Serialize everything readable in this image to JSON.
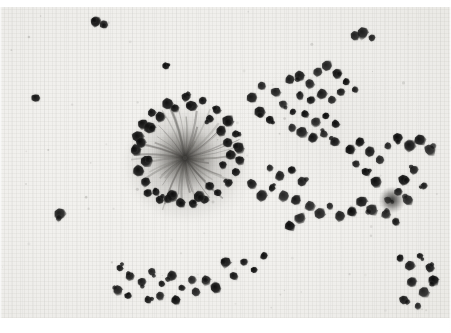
{
  "figure": {
    "caption": "",
    "modality": "light-microscopy",
    "stain_tone": "grayscale",
    "background_color": "#f2f1ee",
    "cell_color": "#1a1a1a",
    "rosette_core_color": "#4a4844",
    "width": 451,
    "height": 333,
    "plate": {
      "x": 0,
      "y": 7,
      "width": 451,
      "height": 311
    }
  },
  "scene": {
    "rosette": {
      "label": "central-rosette",
      "center_x": 185,
      "center_y": 158,
      "core_radius": 34,
      "halo_radius": 62,
      "ray_count": 46,
      "ring_cell_count": 38
    },
    "clusters": [
      {
        "label": "right-upper-cluster",
        "center_x": 330,
        "center_y": 112,
        "cell_count": 34
      },
      {
        "label": "right-lower-cluster",
        "center_x": 392,
        "center_y": 205,
        "cell_count": 22
      },
      {
        "label": "bottom-left-cluster",
        "center_x": 155,
        "center_y": 285,
        "cell_count": 14
      },
      {
        "label": "bottom-right-cluster",
        "center_x": 420,
        "center_y": 275,
        "cell_count": 10
      },
      {
        "label": "scattered-field",
        "center_x": 260,
        "center_y": 200,
        "cell_count": 26
      }
    ],
    "ring_cells": [
      [
        186,
        97
      ],
      [
        203,
        101
      ],
      [
        168,
        104
      ],
      [
        217,
        110
      ],
      [
        152,
        113
      ],
      [
        228,
        121
      ],
      [
        143,
        124
      ],
      [
        236,
        134
      ],
      [
        138,
        137
      ],
      [
        239,
        148
      ],
      [
        136,
        150
      ],
      [
        240,
        160
      ],
      [
        139,
        171
      ],
      [
        236,
        172
      ],
      [
        146,
        182
      ],
      [
        229,
        183
      ],
      [
        156,
        192
      ],
      [
        218,
        193
      ],
      [
        168,
        199
      ],
      [
        205,
        200
      ],
      [
        181,
        203
      ],
      [
        193,
        204
      ],
      [
        160,
        200
      ],
      [
        210,
        186
      ],
      [
        148,
        193
      ],
      [
        223,
        165
      ],
      [
        231,
        155
      ],
      [
        146,
        161
      ],
      [
        141,
        143
      ],
      [
        150,
        128
      ],
      [
        160,
        117
      ],
      [
        175,
        108
      ],
      [
        192,
        106
      ],
      [
        210,
        119
      ],
      [
        221,
        131
      ],
      [
        228,
        143
      ],
      [
        199,
        197
      ],
      [
        172,
        196
      ]
    ],
    "scatter_cells": [
      [
        96,
        22
      ],
      [
        104,
        25
      ],
      [
        355,
        36
      ],
      [
        363,
        33
      ],
      [
        372,
        38
      ],
      [
        290,
        80
      ],
      [
        300,
        76
      ],
      [
        310,
        84
      ],
      [
        318,
        72
      ],
      [
        327,
        66
      ],
      [
        337,
        74
      ],
      [
        346,
        82
      ],
      [
        355,
        90
      ],
      [
        300,
        96
      ],
      [
        311,
        100
      ],
      [
        322,
        94
      ],
      [
        332,
        100
      ],
      [
        341,
        92
      ],
      [
        283,
        104
      ],
      [
        293,
        112
      ],
      [
        305,
        114
      ],
      [
        316,
        122
      ],
      [
        326,
        116
      ],
      [
        336,
        124
      ],
      [
        292,
        128
      ],
      [
        302,
        132
      ],
      [
        313,
        138
      ],
      [
        324,
        134
      ],
      [
        335,
        142
      ],
      [
        270,
        120
      ],
      [
        260,
        112
      ],
      [
        252,
        98
      ],
      [
        262,
        86
      ],
      [
        276,
        92
      ],
      [
        270,
        168
      ],
      [
        280,
        176
      ],
      [
        292,
        170
      ],
      [
        302,
        182
      ],
      [
        272,
        188
      ],
      [
        284,
        196
      ],
      [
        296,
        200
      ],
      [
        262,
        196
      ],
      [
        252,
        184
      ],
      [
        350,
        150
      ],
      [
        360,
        142
      ],
      [
        370,
        152
      ],
      [
        380,
        160
      ],
      [
        356,
        164
      ],
      [
        366,
        172
      ],
      [
        376,
        182
      ],
      [
        388,
        200
      ],
      [
        398,
        192
      ],
      [
        408,
        200
      ],
      [
        386,
        214
      ],
      [
        396,
        222
      ],
      [
        372,
        210
      ],
      [
        362,
        202
      ],
      [
        352,
        212
      ],
      [
        404,
        180
      ],
      [
        414,
        170
      ],
      [
        424,
        186
      ],
      [
        430,
        150
      ],
      [
        420,
        140
      ],
      [
        410,
        146
      ],
      [
        398,
        138
      ],
      [
        388,
        146
      ],
      [
        310,
        206
      ],
      [
        320,
        214
      ],
      [
        330,
        206
      ],
      [
        340,
        216
      ],
      [
        300,
        218
      ],
      [
        290,
        226
      ],
      [
        120,
        268
      ],
      [
        130,
        276
      ],
      [
        142,
        282
      ],
      [
        152,
        272
      ],
      [
        162,
        284
      ],
      [
        172,
        276
      ],
      [
        182,
        288
      ],
      [
        192,
        280
      ],
      [
        118,
        290
      ],
      [
        128,
        296
      ],
      [
        148,
        300
      ],
      [
        160,
        296
      ],
      [
        176,
        300
      ],
      [
        196,
        292
      ],
      [
        206,
        280
      ],
      [
        216,
        288
      ],
      [
        400,
        258
      ],
      [
        410,
        266
      ],
      [
        420,
        256
      ],
      [
        430,
        268
      ],
      [
        412,
        282
      ],
      [
        424,
        292
      ],
      [
        434,
        280
      ],
      [
        404,
        300
      ],
      [
        418,
        306
      ],
      [
        244,
        262
      ],
      [
        254,
        270
      ],
      [
        234,
        276
      ],
      [
        264,
        256
      ],
      [
        226,
        262
      ],
      [
        60,
        214
      ],
      [
        36,
        98
      ],
      [
        166,
        66
      ]
    ]
  },
  "controls": {
    "zoom_label": "",
    "scale_bar": ""
  }
}
